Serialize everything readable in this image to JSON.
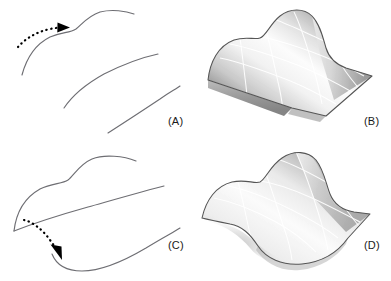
{
  "figure": {
    "background_color": "#ffffff",
    "width": 391,
    "height": 281,
    "curve_color": "#6e6e73",
    "arrow_color": "#000000",
    "surface_outline_color": "#555555",
    "surface_grid_color": "#ffffff",
    "surface_light_color": "#fbfbfb",
    "surface_mid_color": "#d8d8d8",
    "surface_dark_color": "#8f8f8f",
    "label_color": "#1a1a1a"
  },
  "panels": [
    {
      "id": "a",
      "label": "(A)",
      "kind": "curves",
      "description": "Three section profile curves with a dotted arrow indicating sweep direction to the right",
      "arrow": {
        "name": "sweep-direction-arrow",
        "style": "dotted",
        "direction": "right",
        "start": [
          18,
          46
        ],
        "end": [
          63,
          28
        ]
      },
      "curves": [
        {
          "name": "profile-curve-1",
          "points": "22,75 30,52 45,38 62,33 74,31 80,24 88,15 104,11 121,12 134,14"
        },
        {
          "name": "profile-curve-2",
          "points": "64,108 78,92 96,78 118,67 140,59 158,54"
        },
        {
          "name": "profile-curve-3",
          "points": "108,133 126,121 146,108 166,95 180,86"
        }
      ]
    },
    {
      "id": "b",
      "label": "(B)",
      "kind": "surface",
      "description": "Lofted surface generated by sweeping the profile curves of panel A; a ridge runs along the right-hand portion",
      "grid": {
        "u_lines": 5,
        "v_lines": 4
      },
      "shading": "greyscale gradient, darker on lower-left skirt and right flank"
    },
    {
      "id": "c",
      "label": "(C)",
      "kind": "curves",
      "description": "The same three profile curves reordered/reoriented with a dotted arrow indicating sweep direction downward-left",
      "arrow": {
        "name": "sweep-direction-arrow",
        "style": "dotted",
        "direction": "down",
        "start": [
          24,
          79
        ],
        "end": [
          57,
          110
        ]
      },
      "curves": [
        {
          "name": "profile-curve-1",
          "points": "14,90 20,68 32,52 50,42 68,38 78,30 90,20 108,16 124,17 136,20"
        },
        {
          "name": "profile-curve-2",
          "points": "14,90 34,80 58,72 88,64 120,56 148,50 164,46"
        },
        {
          "name": "profile-curve-3",
          "points": "52,115 60,125 76,131 96,130 120,122 144,110 166,96 180,88"
        }
      ]
    },
    {
      "id": "d",
      "label": "(D)",
      "kind": "surface",
      "description": "Lofted surface generated from the panel C curve arrangement; an S-shaped saddle with a peak at upper right and a dip at lower left",
      "grid": {
        "u_lines": 5,
        "v_lines": 4
      },
      "shading": "greyscale gradient, darker near the right crest and the lower-left hollow"
    }
  ]
}
